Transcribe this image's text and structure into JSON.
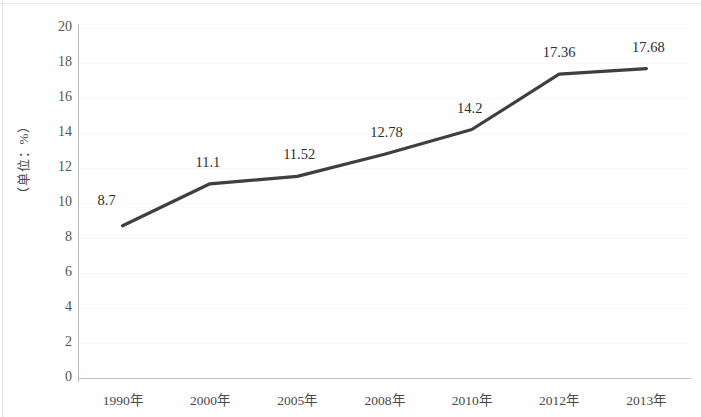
{
  "chart_data": {
    "type": "line",
    "title": "",
    "subtitle": "",
    "xlabel": "",
    "ylabel": "（单位：%）",
    "categories": [
      "1990年",
      "2000年",
      "2005年",
      "2008年",
      "2010年",
      "2012年",
      "2013年"
    ],
    "values": [
      8.7,
      11.1,
      11.52,
      12.78,
      14.2,
      17.36,
      17.68
    ],
    "point_labels": [
      "8.7",
      "11.1",
      "11.52",
      "12.78",
      "14.2",
      "17.36",
      "17.68"
    ],
    "ylim": [
      0,
      20
    ],
    "ytick_step": 2,
    "ytick_labels": [
      "20",
      "18",
      "16",
      "14",
      "12",
      "10",
      "8",
      "6",
      "4",
      "2",
      "0"
    ],
    "grid": true,
    "legend": null,
    "legend_position": "none",
    "series": [
      {
        "name": "",
        "values": [
          8.7,
          11.1,
          11.52,
          12.78,
          14.2,
          17.36,
          17.68
        ],
        "color": "#3f3f3f"
      }
    ]
  },
  "style": {
    "line_color": "#3f3f3f",
    "axis_color": "#b9b9b9",
    "grid_color": "#fafafa",
    "label_color": "#2e2e2e",
    "tick_color": "#555555",
    "background": "#ffffff"
  }
}
